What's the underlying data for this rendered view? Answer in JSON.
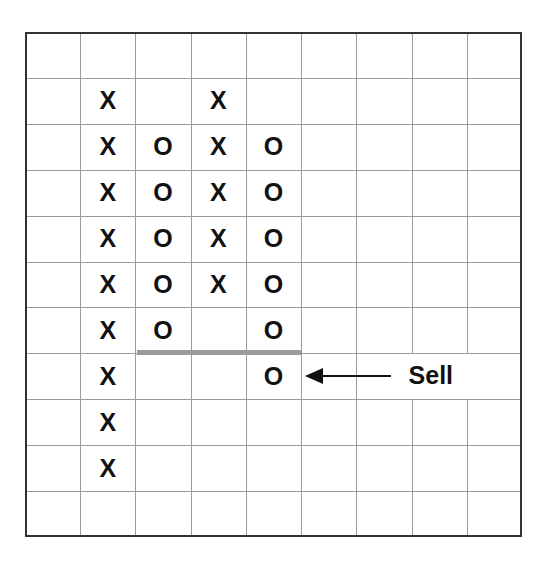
{
  "chart_data": {
    "type": "point-and-figure",
    "title": "",
    "grid": {
      "columns": 9,
      "rows": 11,
      "grid_on": true
    },
    "columns": [
      {
        "index": 1,
        "symbol": "X",
        "rows": [
          1,
          2,
          3,
          4,
          5,
          6,
          7,
          8,
          9
        ]
      },
      {
        "index": 2,
        "symbol": "O",
        "rows": [
          2,
          3,
          4,
          5,
          6
        ]
      },
      {
        "index": 3,
        "symbol": "X",
        "rows": [
          1,
          2,
          3,
          4,
          5
        ]
      },
      {
        "index": 4,
        "symbol": "O",
        "rows": [
          2,
          3,
          4,
          5,
          6,
          7
        ]
      }
    ],
    "support_line": {
      "between_rows": [
        6,
        7
      ],
      "from_column": 2,
      "to_column": 4,
      "color": "#9c9c9c"
    },
    "annotation": {
      "text": "Sell",
      "row": 7,
      "arrow_points_to_column": 4
    }
  },
  "colors": {
    "grid": "#9a9a9a",
    "border": "#333333",
    "symbol": "#111111",
    "support_line": "#9c9c9c"
  }
}
